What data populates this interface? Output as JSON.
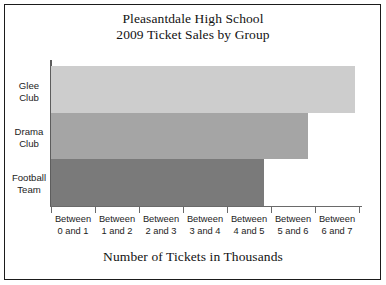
{
  "chart_data": {
    "type": "bar",
    "orientation": "horizontal",
    "title": "Pleasantdale High School 2009 Ticket Sales by Group",
    "title_lines": [
      "Pleasantdale High School",
      "2009 Ticket Sales by Group"
    ],
    "xlabel": "Number of Tickets in Thousands",
    "ylabel": "",
    "categories": [
      "Glee Club",
      "Drama Club",
      "Football Team"
    ],
    "category_lines": [
      [
        "Glee",
        "Club"
      ],
      [
        "Drama",
        "Club"
      ],
      [
        "Football",
        "Team"
      ]
    ],
    "values": [
      6.9,
      5.85,
      4.85
    ],
    "value_bins": [
      "Between 6 and 7",
      "Between 5 and 6",
      "Between 4 and 5"
    ],
    "bar_colors": [
      "#cdcdcd",
      "#a5a5a5",
      "#7a7a7a"
    ],
    "xlim": [
      0,
      7
    ],
    "xticks": [
      0,
      1,
      2,
      3,
      4,
      5,
      6,
      7
    ],
    "xtick_labels": [
      {
        "line1": "Between",
        "line2": "0 and 1"
      },
      {
        "line1": "Between",
        "line2": "1 and 2"
      },
      {
        "line1": "Between",
        "line2": "2 and 3"
      },
      {
        "line1": "Between",
        "line2": "3 and 4"
      },
      {
        "line1": "Between",
        "line2": "4 and 5"
      },
      {
        "line1": "Between",
        "line2": "5 and 6"
      },
      {
        "line1": "Between",
        "line2": "6 and 7"
      }
    ],
    "grid": false,
    "legend": false,
    "axis_color": "#6a6a6a",
    "border_color": "#1b1b1b",
    "background": "#ffffff"
  }
}
